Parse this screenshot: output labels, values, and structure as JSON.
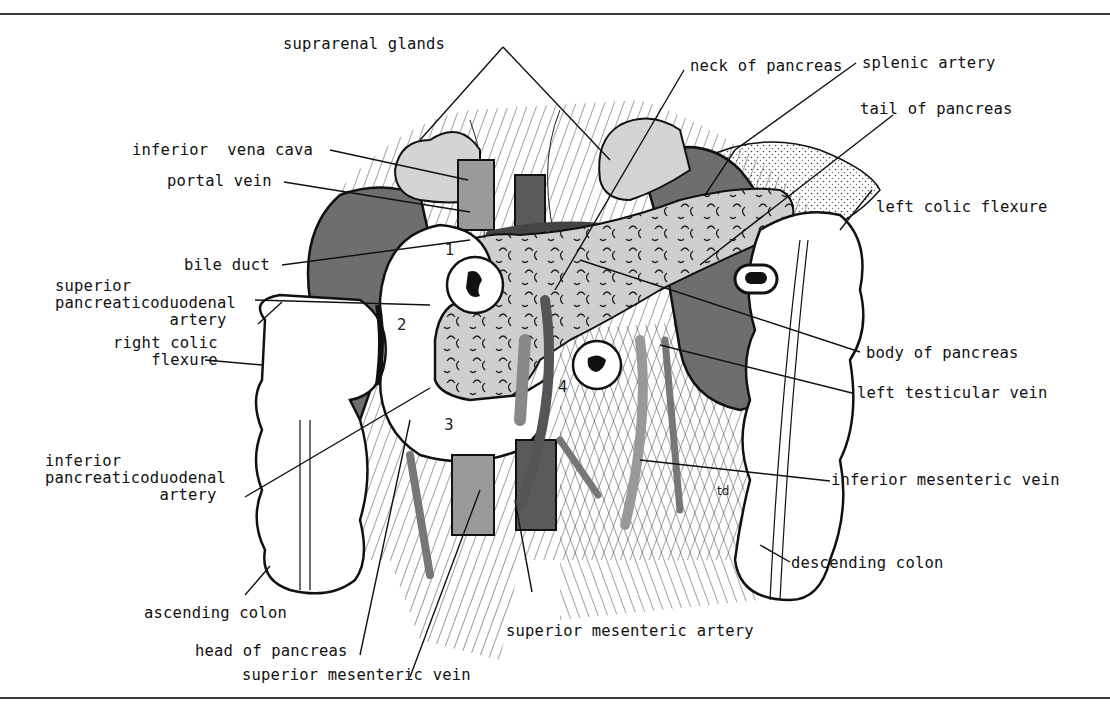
{
  "figure": {
    "type": "anatomical-diagram",
    "colors": {
      "ink": "#111111",
      "kidney": "#6e6e6e",
      "pancreas": "#cfcfcf",
      "suprarenal": "#d4d4d4",
      "vein_dark": "#5a5a5a",
      "vessel_mid": "#8a8a8a",
      "background": "#ffffff",
      "rule": "#3a3a3a"
    },
    "duodenum_part_numbers": [
      "1",
      "2",
      "3",
      "4"
    ],
    "corner_mark": "td"
  },
  "labels": {
    "suprarenal_glands": "suprarenal glands",
    "neck_of_pancreas": "neck of pancreas",
    "splenic_artery": "splenic artery",
    "tail_of_pancreas": "tail of pancreas",
    "inferior_vena_cava": "inferior  vena cava",
    "portal_vein": "portal vein",
    "left_colic_flexure": "left colic flexure",
    "bile_duct": "bile duct",
    "superior_pancreaticoduodenal_artery": "superior\npancreaticoduodenal\n            artery",
    "right_colic_flexure": "right colic\n    flexure",
    "body_of_pancreas": "body of pancreas",
    "left_testicular_vein": "left testicular vein",
    "inferior_pancreaticoduodenal_artery": "inferior\npancreaticoduodenal\n            artery",
    "inferior_mesenteric_vein": "inferior mesenteric vein",
    "descending_colon": "descending colon",
    "ascending_colon": "ascending colon",
    "superior_mesenteric_artery": "superior mesenteric artery",
    "head_of_pancreas": "head of pancreas",
    "superior_mesenteric_vein": "superior mesenteric vein"
  }
}
